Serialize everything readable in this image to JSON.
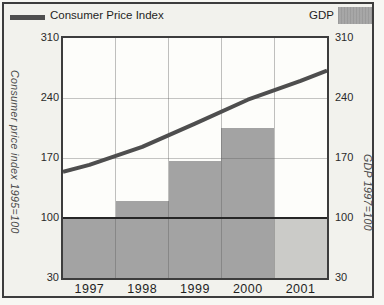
{
  "legend": {
    "line_label": "Consumer Price Index",
    "bar_label": "GDP"
  },
  "left_axis": {
    "title": "Consumer price index 1995=100",
    "ticks": [
      310,
      240,
      170,
      100,
      30
    ]
  },
  "right_axis": {
    "title": "GDP 1997=100",
    "ticks": [
      310,
      240,
      170,
      100,
      30
    ]
  },
  "chart_data": {
    "type": "combo",
    "categories": [
      "1997",
      "1998",
      "1999",
      "2000",
      "2001"
    ],
    "series": [
      {
        "name": "Consumer Price Index",
        "type": "line",
        "values": [
          162,
          183,
          210,
          238,
          260
        ],
        "edge_start_value": 154,
        "edge_end_value": 272
      },
      {
        "name": "GDP",
        "type": "bar",
        "values": [
          100,
          120,
          167,
          205,
          100
        ],
        "last_bar_lighter": true
      }
    ],
    "ylim": [
      30,
      310
    ],
    "reference_line": 100,
    "grid": true,
    "legend_position": "top"
  },
  "colors": {
    "line": "#4e4e4e",
    "bar": "#a3a3a3",
    "bar_last": "#cbcbc8",
    "reference_line": "#262626",
    "frame_border": "#3d3d3d",
    "background": "#f2f2ed",
    "plot_background": "#fdfdfa"
  }
}
